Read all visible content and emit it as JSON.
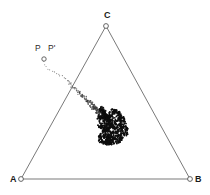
{
  "figure": {
    "background_color": "#ffffff",
    "width": 210,
    "height": 195
  },
  "colors": {
    "edge": "#7a7a7a",
    "marker_stroke": "#555555",
    "marker_fill": "#ffffff",
    "orbit": "#3a3a3a",
    "attractor": "#0d0d0d",
    "label": "#1a1a1a"
  },
  "labels": {
    "vertex_a": "A",
    "vertex_b": "B",
    "vertex_c": "C",
    "point_p": "P",
    "point_p_prime": "P'"
  },
  "chart_data": {
    "type": "scatter",
    "xlabel": "",
    "ylabel": "",
    "xlim": [
      0,
      210
    ],
    "ylim": [
      0,
      195
    ],
    "grid": false,
    "legend": "none",
    "annotations": [
      {
        "text": "C",
        "x": 106,
        "y": 16
      },
      {
        "text": "A",
        "x": 13,
        "y": 181
      },
      {
        "text": "B",
        "x": 196,
        "y": 181
      },
      {
        "text": "P",
        "x": 38,
        "y": 49
      },
      {
        "text": "P'",
        "x": 51,
        "y": 49
      }
    ],
    "vertices": [
      {
        "name": "A",
        "x": 21,
        "y": 179
      },
      {
        "name": "B",
        "x": 190,
        "y": 179
      },
      {
        "name": "C",
        "x": 106,
        "y": 26
      }
    ],
    "edges": [
      {
        "from": "A",
        "to": "B"
      },
      {
        "from": "B",
        "to": "C"
      },
      {
        "from": "C",
        "to": "A"
      }
    ],
    "seed_point": {
      "name": "P",
      "x": 44,
      "y": 59
    },
    "series": [
      {
        "name": "orbit trail",
        "points": [
          [
            44,
            62
          ],
          [
            45,
            65
          ],
          [
            46,
            67
          ],
          [
            48,
            69
          ],
          [
            50,
            70
          ],
          [
            52,
            71
          ],
          [
            54,
            72
          ],
          [
            56,
            73
          ],
          [
            58,
            74
          ],
          [
            60,
            75
          ],
          [
            62,
            76
          ],
          [
            64,
            77
          ],
          [
            66,
            78
          ],
          [
            67,
            80
          ],
          [
            69,
            81
          ],
          [
            70,
            83
          ],
          [
            71,
            84
          ],
          [
            72,
            86
          ],
          [
            73,
            87
          ],
          [
            74,
            88
          ],
          [
            75,
            89
          ],
          [
            76,
            90
          ],
          [
            77,
            91
          ],
          [
            78,
            92
          ],
          [
            79,
            93
          ],
          [
            80,
            93
          ],
          [
            81,
            94
          ],
          [
            82,
            95
          ],
          [
            83,
            96
          ],
          [
            84,
            97
          ],
          [
            85,
            98
          ],
          [
            86,
            99
          ],
          [
            87,
            100
          ],
          [
            88,
            101
          ],
          [
            89,
            102
          ],
          [
            90,
            103
          ],
          [
            91,
            104
          ],
          [
            92,
            105
          ],
          [
            93,
            106
          ],
          [
            94,
            107
          ],
          [
            95,
            108
          ],
          [
            96,
            109
          ],
          [
            97,
            110
          ],
          [
            98,
            111
          ],
          [
            99,
            112
          ],
          [
            100,
            113
          ],
          [
            101,
            114
          ],
          [
            102,
            115
          ],
          [
            103,
            116
          ],
          [
            104,
            117
          ],
          [
            105,
            118
          ],
          [
            106,
            119
          ],
          [
            107,
            120
          ],
          [
            108,
            121
          ],
          [
            109,
            122
          ],
          [
            110,
            123
          ],
          [
            111,
            124
          ],
          [
            112,
            125
          ]
        ]
      },
      {
        "name": "attractor cluster",
        "x_range": [
          99,
          126
        ],
        "y_range": [
          112,
          143
        ],
        "count": 620,
        "density": "high"
      }
    ]
  }
}
